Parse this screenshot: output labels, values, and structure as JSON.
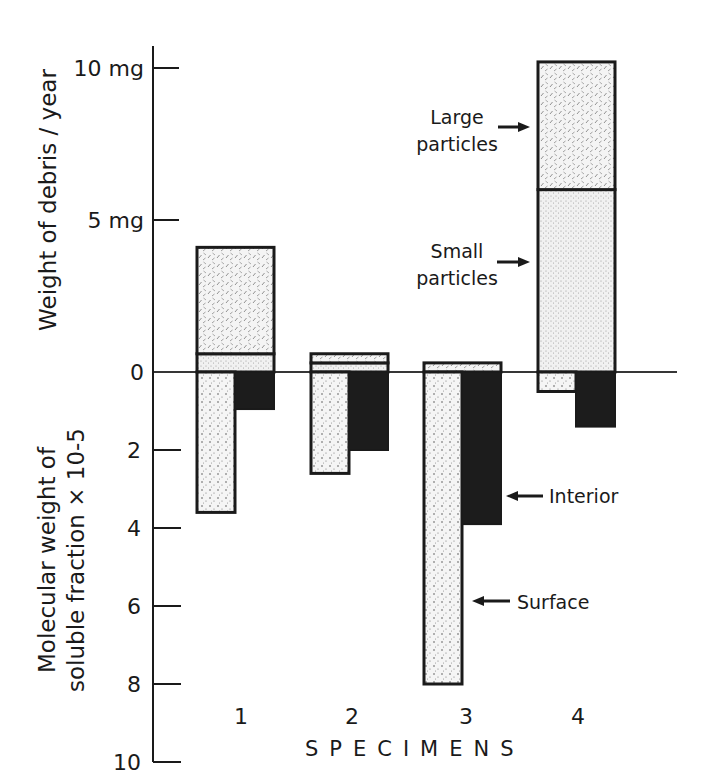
{
  "chart_data": {
    "type": "bar",
    "title": "",
    "categories": [
      "1",
      "2",
      "3",
      "4"
    ],
    "xlabel": "SPECIMENS",
    "upper_axis": {
      "ylabel": "Weight of debris / year",
      "ylim": [
        0,
        10
      ],
      "ticks": [
        {
          "value": 0,
          "label": "0"
        },
        {
          "value": 5,
          "label": "5 mg"
        },
        {
          "value": 10,
          "label": "10 mg"
        }
      ],
      "series": [
        {
          "name": "Small particles",
          "pattern": "fine-stipple",
          "values": [
            0.6,
            0.3,
            0.0,
            6.0
          ]
        },
        {
          "name": "Large particles",
          "pattern": "dash-hatch",
          "values": [
            3.5,
            0.3,
            0.3,
            4.2
          ]
        }
      ],
      "stacked": true,
      "totals": [
        4.1,
        0.6,
        0.3,
        10.2
      ]
    },
    "lower_axis": {
      "ylabel_line1": "Molecular weight of",
      "ylabel_line2": "soluble fraction × 10-5",
      "ylim": [
        0,
        10
      ],
      "inverted": true,
      "ticks": [
        {
          "value": 2,
          "label": "2"
        },
        {
          "value": 4,
          "label": "4"
        },
        {
          "value": 6,
          "label": "6"
        },
        {
          "value": 8,
          "label": "8"
        },
        {
          "value": 10,
          "label": "10"
        }
      ],
      "series": [
        {
          "name": "Surface",
          "pattern": "dots",
          "values": [
            3.6,
            2.6,
            8.0,
            0.5
          ]
        },
        {
          "name": "Interior",
          "pattern": "solid-black",
          "values": [
            0.95,
            2.0,
            3.9,
            1.4
          ]
        }
      ]
    },
    "annotations": [
      {
        "text_line1": "Large",
        "text_line2": "particles",
        "points_to": "specimen 4 large particles"
      },
      {
        "text_line1": "Small",
        "text_line2": "particles",
        "points_to": "specimen 4 small particles"
      },
      {
        "text": "Interior",
        "points_to": "specimen 3 interior"
      },
      {
        "text": "Surface",
        "points_to": "specimen 3 surface"
      }
    ],
    "grid": false,
    "legend": "none (inline arrow annotations)"
  }
}
